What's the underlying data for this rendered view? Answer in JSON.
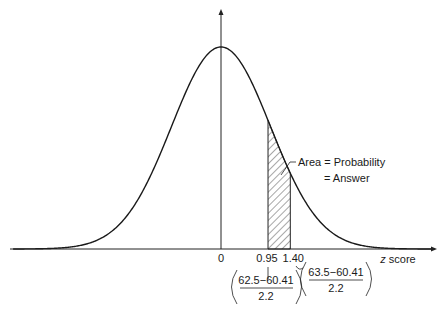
{
  "chart_data": {
    "type": "area",
    "title": "",
    "xlabel_var": "z",
    "xlabel_rest": " score",
    "ylabel": "",
    "xlim": [
      -4.2,
      4.3
    ],
    "distribution": {
      "name": "standard normal",
      "mean": 0,
      "sd": 1
    },
    "shaded_region": {
      "from": 0.95,
      "to": 1.4,
      "style": "hatched"
    },
    "ticks": [
      {
        "value": 0,
        "label": "0"
      },
      {
        "value": 0.95,
        "label": "0.95"
      },
      {
        "value": 1.4,
        "label": "1.40"
      }
    ],
    "annotations": {
      "area_line1": "Area = Probability",
      "area_line2": "= Answer",
      "z1_formula": {
        "numerator": "62.5−60.41",
        "denominator": "2.2"
      },
      "z2_formula": {
        "numerator": "63.5−60.41",
        "denominator": "2.2"
      }
    }
  }
}
